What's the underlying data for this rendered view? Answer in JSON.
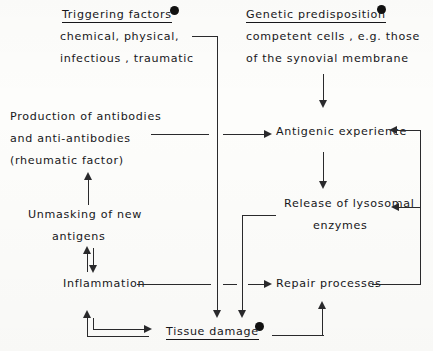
{
  "diagram": {
    "accent_color": "#17171a",
    "line_color": "#2a2a2c",
    "background_color": "#fdfdfb",
    "nodes": {
      "triggering_factors": {
        "heading": "Triggering factors",
        "line2": "chemical, physical,",
        "line3": "infectious , traumatic",
        "marker": "bullet-dot",
        "underlined": true
      },
      "genetic_predisposition": {
        "heading": "Genetic predisposition",
        "line2": "competent cells , e.g. those",
        "line3": "of the synovial membrane",
        "marker": "bullet-dot",
        "underlined": true
      },
      "production_of_antibodies": {
        "line1": "Production of antibodies",
        "line2": "and   anti-antibodies",
        "line3": "(rheumatic factor)"
      },
      "antigenic_experience": {
        "line1": "Antigenic experience"
      },
      "unmasking": {
        "line1": "Unmasking of new",
        "line2": "antigens"
      },
      "release_of_lysosomal": {
        "line1": "Release of lysosomal",
        "line2": "enzymes"
      },
      "inflammation": {
        "line1": "Inflammation"
      },
      "repair_processes": {
        "line1": "Repair processes"
      },
      "tissue_damage": {
        "line1": "Tissue damage",
        "marker": "bullet-dot",
        "underlined": true
      }
    },
    "connectors": [
      {
        "name": "triggering-to-tissue-damage",
        "kind": "elbow-down-arrow"
      },
      {
        "name": "genetic-to-antigenic-experience",
        "kind": "vertical-down-arrow"
      },
      {
        "name": "antibodies-to-antigenic-experience",
        "kind": "horizontal-right-arrow"
      },
      {
        "name": "unmasking-to-antibodies",
        "kind": "vertical-up-arrow"
      },
      {
        "name": "antigenic-to-lysosomal",
        "kind": "vertical-down-arrow"
      },
      {
        "name": "unmasking-inflammation-equilibrium",
        "kind": "double-headed-vertical"
      },
      {
        "name": "inflammation-to-repair-processes",
        "kind": "horizontal-right-arrow"
      },
      {
        "name": "lysosomal-to-tissue-damage",
        "kind": "elbow-down-arrow"
      },
      {
        "name": "repair-feedback-to-antigenic-experience",
        "kind": "elbow-left-arrow"
      },
      {
        "name": "repair-feedback-to-lysosomal",
        "kind": "elbow-left-arrow"
      },
      {
        "name": "tissue-damage-to-repair-processes",
        "kind": "elbow-up-arrow"
      },
      {
        "name": "tissue-damage-to-inflammation-loop",
        "kind": "double-elbow-arrow"
      }
    ]
  }
}
